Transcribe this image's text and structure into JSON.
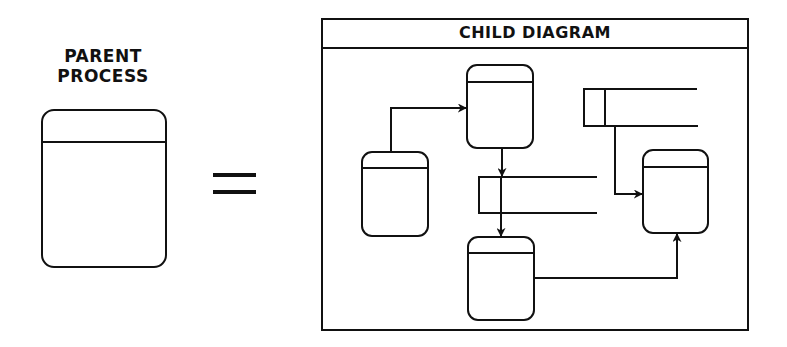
{
  "parent": {
    "label_line1": "PARENT",
    "label_line2": "PROCESS",
    "shape": "process-box"
  },
  "relation": {
    "symbol": "equals-icon"
  },
  "child": {
    "title": "CHILD DIAGRAM",
    "processes": [
      {
        "id": "P1",
        "position": "top-center"
      },
      {
        "id": "P2",
        "position": "left"
      },
      {
        "id": "P3",
        "position": "bottom-center"
      },
      {
        "id": "P4",
        "position": "right"
      }
    ],
    "data_stores": [
      {
        "id": "D1",
        "position": "middle"
      },
      {
        "id": "D2",
        "position": "top-right"
      }
    ],
    "flows": [
      {
        "from": "P2",
        "to": "P1"
      },
      {
        "from": "P1",
        "to": "D1"
      },
      {
        "from": "D1",
        "to": "P3"
      },
      {
        "from": "D2",
        "to": "P4"
      },
      {
        "from": "P3",
        "to": "P4"
      }
    ]
  },
  "colors": {
    "stroke": "#111111",
    "background": "#ffffff"
  }
}
